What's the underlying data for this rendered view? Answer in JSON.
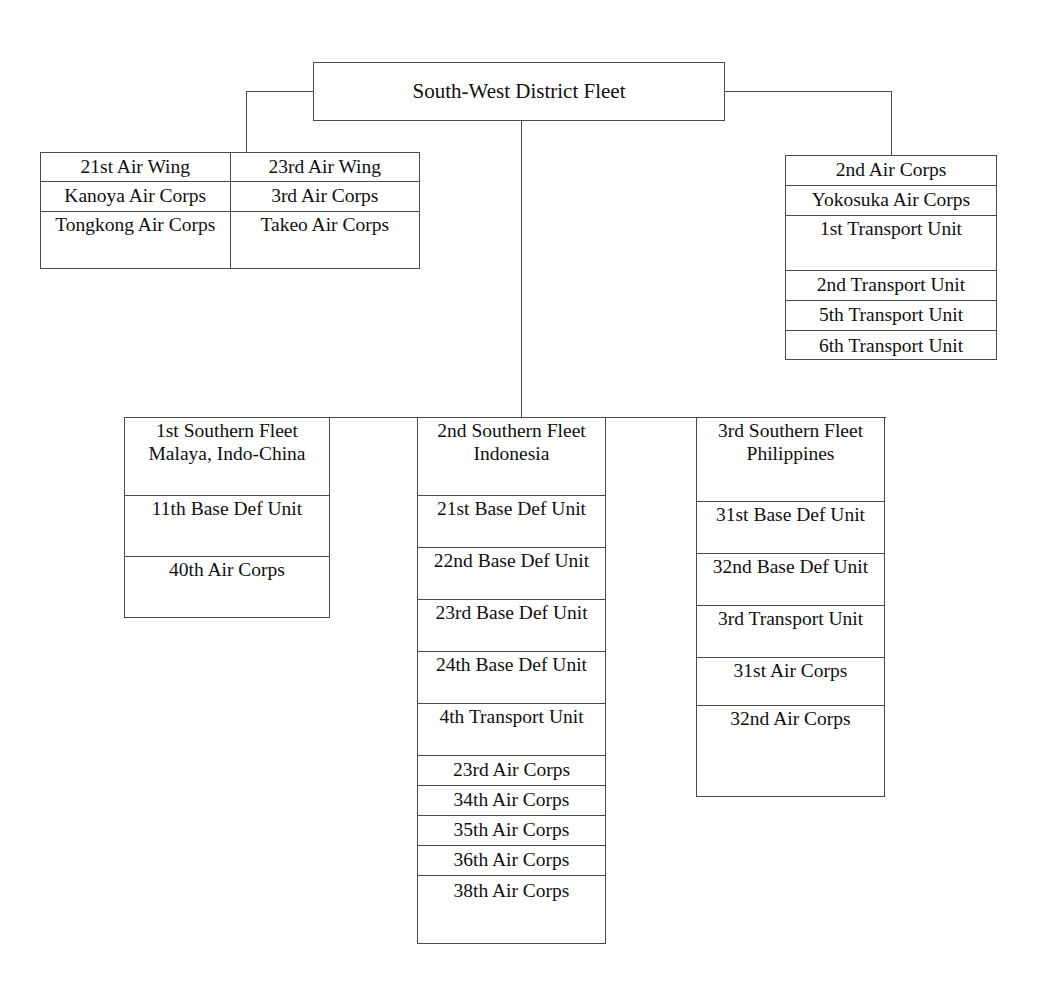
{
  "chart": {
    "type": "org-chart",
    "title": "South-West District Fleet",
    "root": {
      "label": "South-West District Fleet"
    },
    "left_group": {
      "name": "air-wings-group",
      "columns": [
        {
          "header": "21st Air Wing",
          "items": [
            "Kanoya Air Corps",
            "Tongkong Air Corps"
          ]
        },
        {
          "header": "23rd Air Wing",
          "items": [
            "3rd Air Corps",
            "Takeo Air Corps"
          ]
        }
      ]
    },
    "right_group": {
      "name": "second-air-corps-group",
      "header": "2nd Air Corps",
      "items": [
        "Yokosuka Air Corps",
        "1st Transport Unit",
        "2nd Transport Unit",
        "5th Transport Unit",
        "6th Transport Unit"
      ]
    },
    "fleets": [
      {
        "name": "first-southern-fleet",
        "header": "1st Southern Fleet Malaya, Indo-China",
        "items": [
          "11th Base Def Unit",
          "40th Air Corps"
        ]
      },
      {
        "name": "second-southern-fleet",
        "header": "2nd Southern Fleet Indonesia",
        "items": [
          "21st Base Def Unit",
          "22nd Base Def Unit",
          "23rd Base Def Unit",
          "24th Base Def Unit",
          "4th Transport Unit",
          "23rd Air Corps",
          "34th Air Corps",
          "35th Air Corps",
          "36th Air Corps",
          "38th Air Corps"
        ]
      },
      {
        "name": "third-southern-fleet",
        "header": "3rd Southern Fleet Philippines",
        "items": [
          "31st Base Def Unit",
          "32nd Base Def Unit",
          "3rd Transport Unit",
          "31st Air Corps",
          "32nd Air Corps"
        ]
      }
    ],
    "colors": {
      "line": "#4a4a4a",
      "text": "#101010",
      "background": "#ffffff"
    }
  }
}
